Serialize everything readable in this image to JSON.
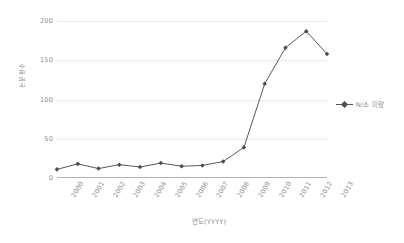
{
  "chart_data": {
    "type": "line",
    "title": "",
    "subtitle": "",
    "xlabel": "연도(YYYY)",
    "ylabel": "논문편수",
    "categories": [
      "2000",
      "2001",
      "2002",
      "2003",
      "2004",
      "2005",
      "2006",
      "2007",
      "2008",
      "2009",
      "2010",
      "2011",
      "2012",
      "2013"
    ],
    "series": [
      {
        "name": "N/소 미량",
        "values": [
          11,
          18,
          12,
          17,
          14,
          19,
          15,
          16,
          21,
          39,
          120,
          166,
          187,
          158
        ]
      }
    ],
    "ylim": [
      0,
      200
    ],
    "yticks": [
      0,
      50,
      100,
      150,
      200
    ],
    "ytick_labels": [
      "0",
      "50",
      "100",
      "150",
      "200"
    ],
    "grid": true,
    "legend_position": "right",
    "line_color": "#595959",
    "marker_color": "#4d4d4d",
    "gridline_color": "#e8e8e8",
    "axis_color": "#b0b0b0",
    "text_color": "#8c8c8c",
    "background": "#ffffff"
  }
}
